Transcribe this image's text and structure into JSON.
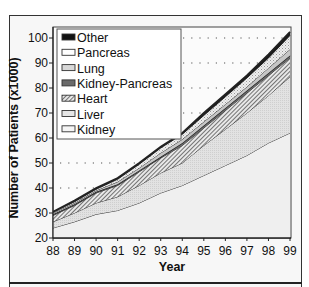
{
  "chart_data": {
    "type": "area",
    "stacked": true,
    "title": "",
    "xlabel": "Year",
    "ylabel": "Number of Patients (x1000)",
    "x": [
      "88",
      "89",
      "90",
      "91",
      "92",
      "93",
      "94",
      "95",
      "96",
      "97",
      "98",
      "99"
    ],
    "ylim": [
      20,
      100
    ],
    "yticks": [
      20,
      30,
      40,
      50,
      60,
      70,
      80,
      90,
      100
    ],
    "grid": "dotted horizontal",
    "legend_position": "upper-left inside",
    "legend_order": [
      "Other",
      "Pancreas",
      "Lung",
      "Kidney-Pancreas",
      "Heart",
      "Liver",
      "Kidney"
    ],
    "cumulative_tops": [
      {
        "name": "Kidney",
        "values": [
          24,
          26.5,
          29.5,
          31,
          34,
          38,
          41,
          45,
          49,
          53,
          58,
          62
        ]
      },
      {
        "name": "Liver",
        "values": [
          26.5,
          30,
          34,
          36.5,
          41,
          46,
          50,
          57,
          63.5,
          70,
          77,
          84.5
        ]
      },
      {
        "name": "Heart",
        "values": [
          29,
          33,
          38,
          41,
          46.5,
          52,
          57,
          64,
          71,
          78,
          85,
          92
        ]
      },
      {
        "name": "Kidney-Pancreas",
        "values": [
          29.5,
          33.5,
          38.5,
          41.5,
          47,
          52.5,
          58,
          65,
          72,
          79,
          86,
          93
        ]
      },
      {
        "name": "Lung",
        "values": [
          30,
          34,
          39,
          42.5,
          48,
          54,
          59.5,
          66.5,
          73.5,
          80.5,
          88,
          95.5
        ]
      },
      {
        "name": "Pancreas",
        "values": [
          30.3,
          34.5,
          39.5,
          43.5,
          49.5,
          56,
          61.5,
          69,
          76.5,
          84,
          92,
          101
        ]
      },
      {
        "name": "Other",
        "values": [
          30.5,
          35,
          40,
          44,
          50,
          56.5,
          62,
          70,
          77.5,
          85,
          93.5,
          102.5
        ]
      }
    ],
    "series_styles": {
      "Kidney": {
        "fill": "#f0f0f0",
        "pattern": "none"
      },
      "Liver": {
        "fill": "#dcdcdc",
        "pattern": "fine-dots"
      },
      "Heart": {
        "fill": "#9a9a9a",
        "pattern": "diagonal-hatch"
      },
      "Kidney-Pancreas": {
        "fill": "#555555",
        "pattern": "solid"
      },
      "Lung": {
        "fill": "#c8c8c8",
        "pattern": "solid"
      },
      "Pancreas": {
        "fill": "#e4e4e4",
        "pattern": "crosshatch"
      },
      "Other": {
        "fill": "#111111",
        "pattern": "solid"
      }
    }
  },
  "labels": {
    "ylabel": "Number of Patients (x1000)",
    "xlabel": "Year",
    "yticks": [
      "20",
      "30",
      "40",
      "50",
      "60",
      "70",
      "80",
      "90",
      "100"
    ],
    "xticks": [
      "88",
      "89",
      "90",
      "91",
      "92",
      "93",
      "94",
      "95",
      "96",
      "97",
      "98",
      "99"
    ]
  },
  "legend": {
    "items": [
      {
        "label": "Other"
      },
      {
        "label": "Pancreas"
      },
      {
        "label": "Lung"
      },
      {
        "label": "Kidney-Pancreas"
      },
      {
        "label": "Heart"
      },
      {
        "label": "Liver"
      },
      {
        "label": "Kidney"
      }
    ]
  }
}
